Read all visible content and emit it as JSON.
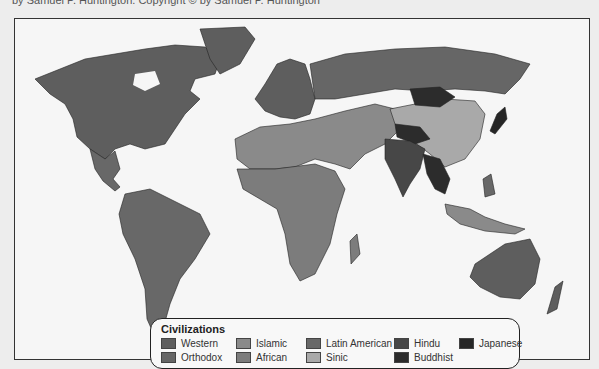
{
  "caption": "by Samuel P. Huntington. Copyright © by Samuel P. Huntington",
  "legend": {
    "title": "Civilizations",
    "items": [
      {
        "label": "Western",
        "color": "#5e5e5e"
      },
      {
        "label": "Orthodox",
        "color": "#666666"
      },
      {
        "label": "Islamic",
        "color": "#8a8a8a"
      },
      {
        "label": "African",
        "color": "#7c7c7c"
      },
      {
        "label": "Latin American",
        "color": "#686868"
      },
      {
        "label": "Sinic",
        "color": "#a9a9a9"
      },
      {
        "label": "Hindu",
        "color": "#474747"
      },
      {
        "label": "Buddhist",
        "color": "#2c2c2c"
      },
      {
        "label": "Japanese",
        "color": "#262626"
      }
    ]
  },
  "regions": {
    "north_america": "Western",
    "latin_america": "Latin American",
    "europe_west": "Western",
    "russia": "Orthodox",
    "north_africa_middle_east": "Islamic",
    "sub_saharan_africa": "African",
    "china": "Sinic",
    "mongolia": "Buddhist",
    "india": "Hindu",
    "southeast_asia_mainland": "Buddhist",
    "japan": "Japanese",
    "indonesia": "Islamic",
    "australia": "Western",
    "greenland": "Western"
  }
}
